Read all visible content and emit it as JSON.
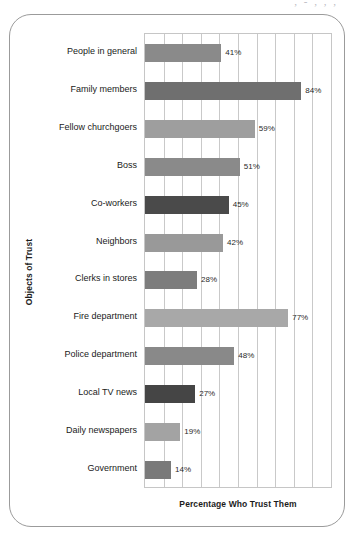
{
  "top_edge_fragment": ", - , , ,",
  "chart_data": {
    "type": "bar",
    "orientation": "horizontal",
    "title": "",
    "xlabel": "Percentage Who Trust Them",
    "ylabel": "Objects of Trust",
    "xlim": [
      0,
      100
    ],
    "xtick_step": 10,
    "grid": true,
    "legend": false,
    "value_suffix": "%",
    "categories": [
      "People in general",
      "Family members",
      "Fellow churchgoers",
      "Boss",
      "Co-workers",
      "Neighbors",
      "Clerks in stores",
      "Fire department",
      "Police department",
      "Local TV news",
      "Daily newspapers",
      "Government"
    ],
    "values": [
      41,
      84,
      59,
      51,
      45,
      42,
      28,
      77,
      48,
      27,
      19,
      14
    ],
    "value_labels": [
      "41%",
      "84%",
      "59%",
      "51%",
      "45%",
      "42%",
      "28%",
      "77%",
      "48%",
      "27%",
      "19%",
      "14%"
    ],
    "bar_colors": [
      "#8a8a8a",
      "#6f6f6f",
      "#9e9e9e",
      "#8a8a8a",
      "#4a4a4a",
      "#999999",
      "#7d7d7d",
      "#a8a8a8",
      "#898989",
      "#454545",
      "#a3a3a3",
      "#7a7a7a"
    ]
  },
  "colors": {
    "frame_border": "#9b9b9b",
    "plot_border": "#c6c6c6",
    "gridline": "#c9c9c9",
    "text": "#1a1a1a",
    "background": "#ffffff"
  }
}
